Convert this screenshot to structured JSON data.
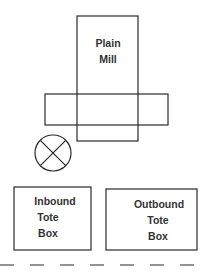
{
  "diagram": {
    "line_color": "#2a2a2a",
    "mill": {
      "lines": [
        "Plain",
        "Mill"
      ]
    },
    "operator_symbol": "operator-position-x-circle",
    "inbound": {
      "lines": [
        "Inbound",
        "Tote",
        "Box"
      ]
    },
    "outbound": {
      "lines": [
        "Outbound",
        "Tote",
        "Box"
      ]
    },
    "aisle": "dashed-line"
  }
}
